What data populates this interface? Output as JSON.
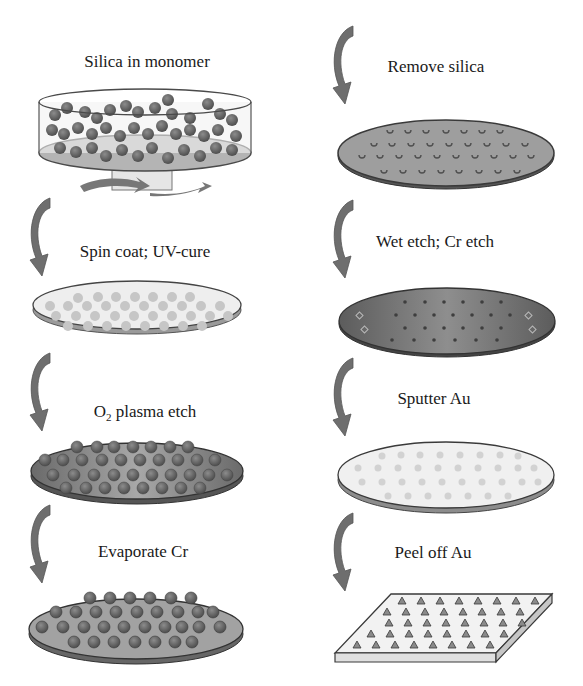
{
  "diagram": {
    "type": "process-flow",
    "columns": 2,
    "steps": [
      {
        "id": 1,
        "label": "Silica in monomer",
        "column": "left",
        "illustration": "dish-with-silica-spheres-on-spinner"
      },
      {
        "id": 2,
        "label": "Spin coat; UV-cure",
        "column": "left",
        "illustration": "light-wafer-embedded-spheres"
      },
      {
        "id": 3,
        "label_main": "O",
        "label_sub": "2",
        "label_rest": " plasma etch",
        "label": "O2 plasma etch",
        "column": "left",
        "illustration": "dark-wafer-exposed-spheres"
      },
      {
        "id": 4,
        "label": "Evaporate Cr",
        "column": "left",
        "illustration": "wafer-spheres-coated-cr"
      },
      {
        "id": 5,
        "label": "Remove silica",
        "column": "right",
        "illustration": "wafer-with-holes"
      },
      {
        "id": 6,
        "label": "Wet etch; Cr etch",
        "column": "right",
        "illustration": "dark-wafer-pits"
      },
      {
        "id": 7,
        "label": "Sputter Au",
        "column": "right",
        "illustration": "light-wafer-au-coated"
      },
      {
        "id": 8,
        "label": "Peel off Au",
        "column": "right",
        "illustration": "au-film-pyramid-array"
      }
    ],
    "arrow_icon": "curved-down-arrow",
    "colors": {
      "arrow": "#6e6e6e",
      "dark_fill": "#8a8a8a",
      "sphere": "#6a6a6a",
      "light_fill": "#ececec",
      "outline": "#3c3c3c"
    }
  }
}
